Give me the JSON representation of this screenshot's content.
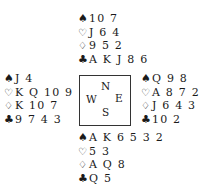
{
  "suit_symbols": {
    "spades": "♠",
    "hearts": "♡",
    "diamonds": "♢",
    "clubs": "♣"
  },
  "compass": {
    "north": "N",
    "west": "W",
    "east": "E",
    "south": "S"
  },
  "hands": {
    "north": {
      "spades": "10 7",
      "hearts": "J 6 4",
      "diamonds": "9 5 2",
      "clubs": "A K J 8 6"
    },
    "west": {
      "spades": "J 4",
      "hearts": "K Q 10 9",
      "diamonds": "K 10 7",
      "clubs": "9 7 4 3"
    },
    "east": {
      "spades": "Q 9 8",
      "hearts": "A 8 7 2",
      "diamonds": "J 6 4 3",
      "clubs": "10 2"
    },
    "south": {
      "spades": "A K 6 5 3 2",
      "hearts": "5 3",
      "diamonds": "A Q 8",
      "clubs": "Q 5"
    }
  }
}
